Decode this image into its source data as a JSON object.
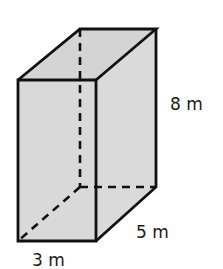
{
  "figure": {
    "shape": "rectangular prism",
    "fill_color": "#d9d9d9",
    "edge_color": "#111111",
    "labels": {
      "height": "8 m",
      "depth": "5 m",
      "width": "3 m"
    },
    "dimensions": {
      "width": 3,
      "depth": 5,
      "height": 8,
      "unit": "m"
    }
  }
}
